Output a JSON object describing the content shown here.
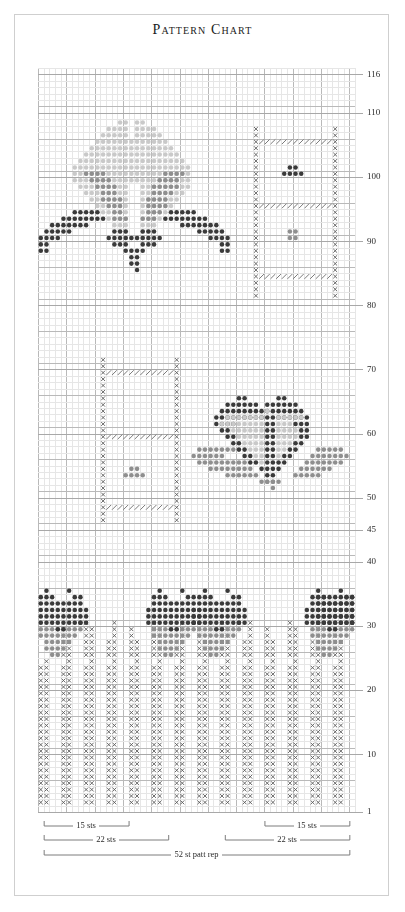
{
  "page": {
    "title": "Pattern Chart",
    "background": "#ffffff",
    "frame_border_color": "#cfcfcf"
  },
  "legend_colors": {
    "dark_dot": "#3a3a3a",
    "mid_dot": "#8f8f8f",
    "light_dot": "#c9c9c9",
    "cross_stitch": "#5a5a5a",
    "diagonal_hatch": "#7a7a7a",
    "grid_minor": "#e6e6e6",
    "grid_major": "#b9b9b9",
    "label_text": "#2b2b2b",
    "bracket_line": "#7d7d7d"
  },
  "chart_data": {
    "type": "heatmap",
    "title": "Pattern Chart",
    "xlabel": "",
    "ylabel": "",
    "columns": 56,
    "rows": 116,
    "grid": true,
    "grid_major_every": 5,
    "row_label_side": "right",
    "row_labels": [
      116,
      110,
      100,
      90,
      80,
      70,
      60,
      50,
      45,
      40,
      30,
      20,
      10,
      1
    ],
    "symbol_key": [
      {
        "code": "D",
        "name": "dark-dot",
        "color": "#3a3a3a",
        "shape": "dot"
      },
      {
        "code": "M",
        "name": "mid-gray-dot",
        "color": "#8f8f8f",
        "shape": "dot"
      },
      {
        "code": "L",
        "name": "light-gray-dot",
        "color": "#c9c9c9",
        "shape": "dot"
      },
      {
        "code": "X",
        "name": "cross-stitch",
        "color": "#5a5a5a",
        "shape": "cross"
      },
      {
        "code": "/",
        "name": "diagonal-hatch",
        "color": "#7a7a7a",
        "shape": "slash"
      }
    ],
    "motifs": [
      {
        "name": "top-fan-butterfly",
        "row_range": [
          88,
          106
        ],
        "col_range": [
          3,
          30
        ],
        "symbols": [
          "L",
          "M",
          "D"
        ]
      },
      {
        "name": "top-right-lace-panel",
        "row_range": [
          80,
          106
        ],
        "col_range": [
          37,
          52
        ],
        "symbols": [
          "X",
          "/",
          "D",
          "M"
        ]
      },
      {
        "name": "mid-left-lace-panel",
        "row_range": [
          45,
          70
        ],
        "col_range": [
          10,
          25
        ],
        "symbols": [
          "X",
          "/",
          "M"
        ]
      },
      {
        "name": "mid-right-heart-butterfly",
        "row_range": [
          52,
          64
        ],
        "col_range": [
          28,
          54
        ],
        "symbols": [
          "D",
          "L",
          "M"
        ]
      },
      {
        "name": "bottom-scallop-row",
        "row_range": [
          24,
          32
        ],
        "col_range": [
          1,
          56
        ],
        "symbols": [
          "D",
          "M"
        ]
      },
      {
        "name": "bottom-rib-field",
        "row_range": [
          1,
          24
        ],
        "col_range": [
          1,
          56
        ],
        "symbols": [
          "X"
        ]
      }
    ],
    "brackets": [
      {
        "label": "15 sts",
        "col_start": 2,
        "col_end": 16,
        "tier": 0
      },
      {
        "label": "22 sts",
        "col_start": 2,
        "col_end": 23,
        "tier": 1
      },
      {
        "label": "15 sts",
        "col_start": 41,
        "col_end": 55,
        "tier": 0
      },
      {
        "label": "22 sts",
        "col_start": 34,
        "col_end": 55,
        "tier": 1
      },
      {
        "label": "52 st patt rep",
        "col_start": 2,
        "col_end": 55,
        "tier": 2
      }
    ]
  }
}
